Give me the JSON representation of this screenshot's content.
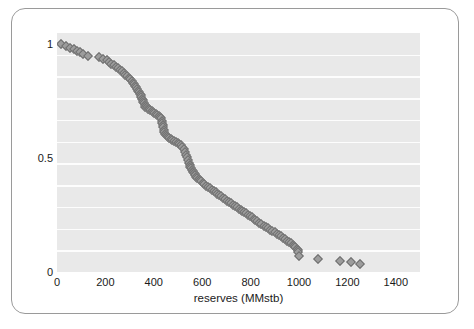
{
  "figure": {
    "border_color": "#9a9a9a",
    "background": "#ffffff"
  },
  "chart_data": {
    "type": "scatter",
    "title": "",
    "subtitle": "",
    "xlabel": "reserves (MMstb)",
    "ylabel": "",
    "xlim": [
      0,
      1500
    ],
    "ylim": [
      0,
      1.05
    ],
    "xticks": [
      0,
      200,
      400,
      600,
      800,
      1000,
      1200,
      1400
    ],
    "xtick_labels": [
      "0",
      "200",
      "400",
      "600",
      "800",
      "1000",
      "1200",
      "1400"
    ],
    "yticks": [
      0,
      0.5,
      1
    ],
    "ytick_labels": [
      "0",
      "0.5",
      "1"
    ],
    "grid": "horizontal-white-on-gray",
    "gridline_count": 10,
    "plot_background": "#e9e9e9",
    "gridline_color": "#fdfdfd",
    "legend": null,
    "marker": {
      "shape": "diamond",
      "fill": "#9d9d9d",
      "edge": "#6f6f6f",
      "size_px": 7
    },
    "series": [
      {
        "name": "cumulative probability of exceedance",
        "x": [
          15,
          38,
          55,
          70,
          82,
          95,
          108,
          130,
          175,
          190,
          205,
          215,
          225,
          235,
          244,
          252,
          260,
          268,
          275,
          282,
          289,
          296,
          302,
          308,
          314,
          319,
          324,
          328,
          332,
          336,
          340,
          343,
          346,
          349,
          352,
          355,
          357,
          360,
          362,
          365,
          368,
          371,
          374,
          378,
          382,
          386,
          391,
          396,
          402,
          408,
          414,
          420,
          425,
          429,
          432,
          435,
          437,
          439,
          441,
          443,
          446,
          449,
          453,
          458,
          464,
          470,
          477,
          484,
          491,
          498,
          505,
          512,
          518,
          524,
          529,
          534,
          538,
          542,
          545,
          548,
          551,
          554,
          557,
          560,
          563,
          566,
          569,
          572,
          576,
          580,
          585,
          590,
          596,
          602,
          609,
          616,
          623,
          631,
          639,
          647,
          655,
          663,
          671,
          679,
          687,
          695,
          703,
          711,
          719,
          727,
          735,
          743,
          751,
          759,
          766,
          773,
          780,
          788,
          796,
          804,
          812,
          820,
          828,
          836,
          845,
          854,
          863,
          872,
          881,
          890,
          899,
          908,
          917,
          926,
          935,
          944,
          952,
          960,
          967,
          974,
          980,
          985,
          990,
          994,
          997,
          1000,
          1080,
          1170,
          1215,
          1250
        ],
        "y": [
          1.0,
          0.993,
          0.986,
          0.979,
          0.972,
          0.965,
          0.958,
          0.951,
          0.944,
          0.937,
          0.93,
          0.923,
          0.916,
          0.909,
          0.902,
          0.895,
          0.888,
          0.881,
          0.874,
          0.867,
          0.86,
          0.853,
          0.846,
          0.839,
          0.832,
          0.825,
          0.818,
          0.811,
          0.804,
          0.797,
          0.79,
          0.783,
          0.776,
          0.769,
          0.762,
          0.755,
          0.748,
          0.741,
          0.734,
          0.727,
          0.73,
          0.726,
          0.722,
          0.718,
          0.714,
          0.71,
          0.706,
          0.702,
          0.698,
          0.694,
          0.69,
          0.686,
          0.682,
          0.675,
          0.665,
          0.655,
          0.645,
          0.635,
          0.625,
          0.615,
          0.608,
          0.602,
          0.597,
          0.592,
          0.588,
          0.584,
          0.58,
          0.576,
          0.572,
          0.568,
          0.564,
          0.558,
          0.55,
          0.54,
          0.528,
          0.516,
          0.504,
          0.492,
          0.48,
          0.47,
          0.462,
          0.455,
          0.449,
          0.444,
          0.439,
          0.434,
          0.429,
          0.424,
          0.419,
          0.414,
          0.409,
          0.404,
          0.398,
          0.392,
          0.386,
          0.38,
          0.374,
          0.368,
          0.362,
          0.356,
          0.35,
          0.344,
          0.338,
          0.332,
          0.326,
          0.32,
          0.314,
          0.308,
          0.302,
          0.296,
          0.29,
          0.284,
          0.278,
          0.272,
          0.266,
          0.262,
          0.258,
          0.252,
          0.246,
          0.24,
          0.234,
          0.228,
          0.222,
          0.216,
          0.21,
          0.204,
          0.198,
          0.192,
          0.186,
          0.18,
          0.174,
          0.168,
          0.162,
          0.156,
          0.15,
          0.144,
          0.138,
          0.132,
          0.126,
          0.12,
          0.114,
          0.108,
          0.102,
          0.096,
          0.09,
          0.07,
          0.058,
          0.048,
          0.042,
          0.036
        ]
      }
    ]
  }
}
